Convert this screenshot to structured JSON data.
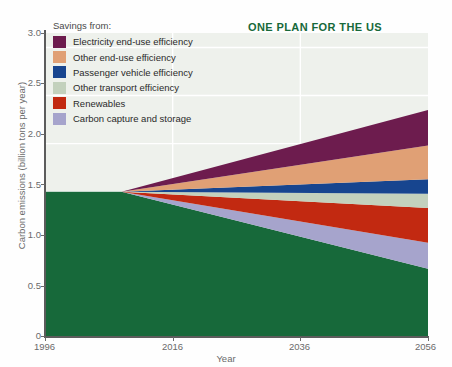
{
  "headline": "ONE PLAN FOR THE US",
  "legend": {
    "title": "Savings from:",
    "items": [
      {
        "label": "Electricity end-use efficiency",
        "color": "#6d1c4e"
      },
      {
        "label": "Other end-use efficiency",
        "color": "#e0a075"
      },
      {
        "label": "Passenger vehicle efficiency",
        "color": "#17458f"
      },
      {
        "label": "Other transport efficiency",
        "color": "#c3d1bd"
      },
      {
        "label": "Renewables",
        "color": "#c22911"
      },
      {
        "label": "Carbon capture and storage",
        "color": "#a6a4cc"
      }
    ]
  },
  "axes": {
    "y_title": "Carbon emissions (billion tons per year)",
    "x_title": "Year",
    "y_ticks": [
      "3.0",
      "2.5",
      "2.0",
      "1.5",
      "1.0",
      "0.5",
      "0"
    ],
    "x_ticks": [
      "1996",
      "2016",
      "2036",
      "2056"
    ]
  },
  "colors": {
    "baseline_green": "#17693a",
    "plot_background": "#eef1ec",
    "gridline": "#ffffff",
    "axis": "#5c5c5c",
    "tick_text": "#6a6a6a",
    "headline": "#17693a"
  },
  "chart_data": {
    "type": "area",
    "title": "ONE PLAN FOR THE US",
    "xlabel": "Year",
    "ylabel": "Carbon emissions (billion tons per year)",
    "xlim": [
      1996,
      2056
    ],
    "ylim": [
      0,
      3.15
    ],
    "grid": true,
    "legend_position": "top-left",
    "legend_title": "Savings from:",
    "x": [
      1996,
      2008,
      2056
    ],
    "note": "Stacked wedges fan out from a single branch point at 2008 where total = 1.50; the green 'actual emissions' band falls to 0.70 by 2056 while each savings wedge grows from 0.",
    "branch_point": {
      "year": 2008,
      "value": 1.5
    },
    "series": [
      {
        "name": "Actual emissions (baseline path)",
        "color": "#17693a",
        "values": [
          1.5,
          1.5,
          0.7
        ]
      },
      {
        "name": "Carbon capture and storage",
        "color": "#a6a4cc",
        "values": [
          0,
          0,
          0.27
        ]
      },
      {
        "name": "Renewables",
        "color": "#c22911",
        "values": [
          0,
          0,
          0.36
        ]
      },
      {
        "name": "Other transport efficiency",
        "color": "#c3d1bd",
        "values": [
          0,
          0,
          0.15
        ]
      },
      {
        "name": "Passenger vehicle efficiency",
        "color": "#17458f",
        "values": [
          0,
          0,
          0.15
        ]
      },
      {
        "name": "Other end-use efficiency",
        "color": "#e0a075",
        "values": [
          0,
          0,
          0.35
        ]
      },
      {
        "name": "Electricity end-use efficiency",
        "color": "#6d1c4e",
        "values": [
          0,
          0,
          0.37
        ]
      }
    ],
    "cumulative_tops_2056": {
      "green": 0.7,
      "carbon_capture_and_storage": 0.97,
      "renewables": 1.33,
      "other_transport_efficiency": 1.48,
      "passenger_vehicle_efficiency": 1.63,
      "other_end_use_efficiency": 1.98,
      "electricity_end_use_efficiency": 2.35,
      "total": 2.35
    },
    "gridlines_y": [
      0.5,
      1.0,
      1.5,
      2.0,
      2.5,
      3.0
    ],
    "gridlines_x": [
      2016,
      2036
    ]
  }
}
